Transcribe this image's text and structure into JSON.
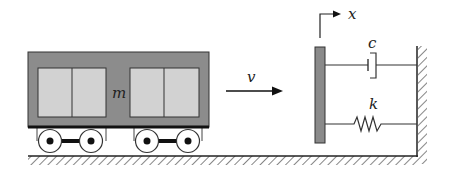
{
  "diagram": {
    "title": "",
    "labels": {
      "mass": "m",
      "velocity": "v",
      "displacement": "x",
      "damper": "c",
      "spring": "k"
    },
    "colors": {
      "cart_body": "#8c8c8c",
      "cart_window": "#d2d2d2",
      "plate": "#8a8a8a",
      "line": "#222222",
      "background": "#ffffff"
    }
  }
}
